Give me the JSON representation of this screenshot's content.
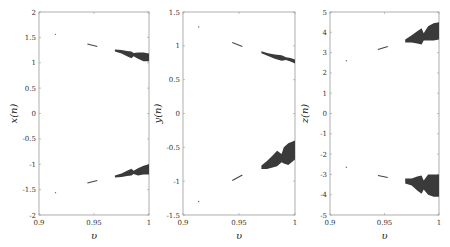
{
  "chart_data": [
    {
      "type": "scatter",
      "title": "",
      "xlabel": "υ",
      "ylabel": "x(n)",
      "xlim": [
        0.9,
        1.0
      ],
      "ylim": [
        -2,
        2
      ],
      "xticks": [
        0.9,
        0.95,
        1.0
      ],
      "xtick_labels": [
        "0.9",
        "0.95",
        "1"
      ],
      "yticks": [
        -2,
        -1.5,
        -1,
        -0.5,
        0,
        0.5,
        1,
        1.5,
        2
      ],
      "ytick_labels": [
        "-2",
        "-1.5",
        "-1",
        "-0.5",
        "0",
        "0.5",
        "1",
        "1.5",
        "2"
      ],
      "grid": false,
      "isolated_points": [
        {
          "x": 0.915,
          "y": 1.56
        },
        {
          "x": 0.915,
          "y": -1.56
        }
      ],
      "segments": [
        {
          "x": [
            0.944,
            0.953
          ],
          "y": [
            1.37,
            1.32
          ]
        },
        {
          "x": [
            0.944,
            0.953
          ],
          "y": [
            -1.37,
            -1.32
          ]
        }
      ],
      "bands": [
        {
          "x": [
            0.969,
            0.975,
            0.98,
            0.984,
            0.986,
            0.99,
            0.995,
            1.0
          ],
          "y_top": [
            1.26,
            1.25,
            1.23,
            1.22,
            1.19,
            1.2,
            1.2,
            1.18
          ],
          "y_bottom": [
            1.22,
            1.18,
            1.13,
            1.09,
            1.13,
            1.08,
            1.03,
            1.03
          ]
        },
        {
          "x": [
            0.969,
            0.975,
            0.98,
            0.984,
            0.986,
            0.99,
            0.995,
            1.0
          ],
          "y_top": [
            -1.22,
            -1.18,
            -1.13,
            -1.09,
            -1.13,
            -1.08,
            -1.03,
            -1.0
          ],
          "y_bottom": [
            -1.26,
            -1.25,
            -1.23,
            -1.22,
            -1.19,
            -1.22,
            -1.2,
            -1.2
          ]
        }
      ]
    },
    {
      "type": "scatter",
      "title": "",
      "xlabel": "υ",
      "ylabel": "y(n)",
      "xlim": [
        0.9,
        1.0
      ],
      "ylim": [
        -1.5,
        1.5
      ],
      "xticks": [
        0.9,
        0.95,
        1.0
      ],
      "xtick_labels": [
        "0.9",
        "0.95",
        "1"
      ],
      "yticks": [
        -1.5,
        -1,
        -0.5,
        0,
        0.5,
        1,
        1.5
      ],
      "ytick_labels": [
        "-1.5",
        "-1",
        "-0.5",
        "0",
        "0.5",
        "1",
        "1.5"
      ],
      "grid": false,
      "isolated_points": [
        {
          "x": 0.914,
          "y": 1.28
        },
        {
          "x": 0.914,
          "y": -1.3
        }
      ],
      "segments": [
        {
          "x": [
            0.944,
            0.953
          ],
          "y": [
            1.05,
            0.99
          ]
        },
        {
          "x": [
            0.944,
            0.953
          ],
          "y": [
            -0.99,
            -0.91
          ]
        }
      ],
      "bands": [
        {
          "x": [
            0.97,
            0.976,
            0.982,
            0.988,
            0.992,
            0.996,
            1.0
          ],
          "y_top": [
            0.92,
            0.89,
            0.87,
            0.86,
            0.83,
            0.82,
            0.8
          ],
          "y_bottom": [
            0.89,
            0.85,
            0.81,
            0.78,
            0.79,
            0.77,
            0.74
          ]
        },
        {
          "x": [
            0.97,
            0.975,
            0.98,
            0.984,
            0.988,
            0.99,
            0.994,
            1.0
          ],
          "y_top": [
            -0.77,
            -0.7,
            -0.62,
            -0.55,
            -0.6,
            -0.5,
            -0.44,
            -0.4
          ],
          "y_bottom": [
            -0.82,
            -0.82,
            -0.8,
            -0.78,
            -0.72,
            -0.74,
            -0.76,
            -0.68
          ]
        }
      ]
    },
    {
      "type": "scatter",
      "title": "",
      "xlabel": "υ",
      "ylabel": "z(n)",
      "xlim": [
        0.9,
        1.0
      ],
      "ylim": [
        -5,
        5
      ],
      "xticks": [
        0.9,
        0.95,
        1.0
      ],
      "xtick_labels": [
        "0.9",
        "0.95",
        "1"
      ],
      "yticks": [
        -5,
        -4,
        -3,
        -2,
        -1,
        0,
        1,
        2,
        3,
        4,
        5
      ],
      "ytick_labels": [
        "-5",
        "-4",
        "-3",
        "-2",
        "-1",
        "0",
        "1",
        "2",
        "3",
        "4",
        "5"
      ],
      "grid": false,
      "isolated_points": [
        {
          "x": 0.915,
          "y": 2.6
        },
        {
          "x": 0.915,
          "y": -2.65
        }
      ],
      "segments": [
        {
          "x": [
            0.944,
            0.953
          ],
          "y": [
            3.15,
            3.3
          ]
        },
        {
          "x": [
            0.944,
            0.953
          ],
          "y": [
            -3.05,
            -3.15
          ]
        }
      ],
      "bands": [
        {
          "x": [
            0.969,
            0.975,
            0.98,
            0.984,
            0.986,
            0.99,
            0.995,
            1.0
          ],
          "y_top": [
            3.65,
            3.85,
            4.05,
            4.2,
            3.95,
            4.3,
            4.45,
            4.5
          ],
          "y_bottom": [
            3.5,
            3.5,
            3.45,
            3.4,
            3.6,
            3.6,
            3.6,
            3.65
          ]
        },
        {
          "x": [
            0.969,
            0.975,
            0.98,
            0.984,
            0.986,
            0.99,
            0.995,
            1.0
          ],
          "y_top": [
            -3.2,
            -3.2,
            -3.1,
            -3.05,
            -3.3,
            -3.0,
            -3.0,
            -3.0
          ],
          "y_bottom": [
            -3.45,
            -3.55,
            -3.8,
            -3.95,
            -3.75,
            -4.0,
            -4.1,
            -4.1
          ]
        }
      ]
    }
  ]
}
